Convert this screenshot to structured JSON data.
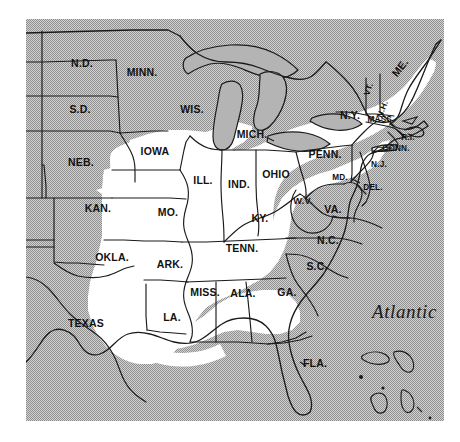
{
  "figure": {
    "kind": "reference-map",
    "background_color": "#b4b4b4",
    "land_highlight_color": "#ffffff",
    "ink_color": "#1a1a1a",
    "page_color": "#ffffff"
  },
  "ocean": {
    "atlantic_label": "Atlantic"
  },
  "states": [
    {
      "id": "nd",
      "label": "N.D.",
      "x": 82,
      "y": 67,
      "size": "normal"
    },
    {
      "id": "sd",
      "label": "S.D.",
      "x": 80,
      "y": 113,
      "size": "normal"
    },
    {
      "id": "neb",
      "label": "NEB.",
      "x": 81,
      "y": 166,
      "size": "normal"
    },
    {
      "id": "kan",
      "label": "KAN.",
      "x": 98,
      "y": 212,
      "size": "normal"
    },
    {
      "id": "okla",
      "label": "OKLA.",
      "x": 112,
      "y": 261,
      "size": "normal"
    },
    {
      "id": "texas",
      "label": "TEXAS",
      "x": 86,
      "y": 327,
      "size": "normal"
    },
    {
      "id": "minn",
      "label": "MINN.",
      "x": 142,
      "y": 76,
      "size": "normal"
    },
    {
      "id": "iowa",
      "label": "IOWA",
      "x": 155,
      "y": 155,
      "size": "normal"
    },
    {
      "id": "mo",
      "label": "MO.",
      "x": 168,
      "y": 216,
      "size": "normal"
    },
    {
      "id": "ark",
      "label": "ARK.",
      "x": 170,
      "y": 268,
      "size": "normal"
    },
    {
      "id": "la",
      "label": "LA.",
      "x": 172,
      "y": 321,
      "size": "normal"
    },
    {
      "id": "wis",
      "label": "WIS.",
      "x": 192,
      "y": 113,
      "size": "normal"
    },
    {
      "id": "ill",
      "label": "ILL.",
      "x": 203,
      "y": 184,
      "size": "normal"
    },
    {
      "id": "miss",
      "label": "MISS.",
      "x": 205,
      "y": 296,
      "size": "normal"
    },
    {
      "id": "mich",
      "label": "MICH.",
      "x": 252,
      "y": 138,
      "size": "normal"
    },
    {
      "id": "ind",
      "label": "IND.",
      "x": 239,
      "y": 188,
      "size": "normal"
    },
    {
      "id": "tenn",
      "label": "TENN.",
      "x": 242,
      "y": 252,
      "size": "normal"
    },
    {
      "id": "ala",
      "label": "ALA.",
      "x": 243,
      "y": 297,
      "size": "normal"
    },
    {
      "id": "ohio",
      "label": "OHIO",
      "x": 276,
      "y": 178,
      "size": "normal"
    },
    {
      "id": "ky",
      "label": "KY.",
      "x": 260,
      "y": 222,
      "size": "normal"
    },
    {
      "id": "ga",
      "label": "GA.",
      "x": 287,
      "y": 296,
      "size": "normal"
    },
    {
      "id": "wv",
      "label": "W.V.",
      "x": 303,
      "y": 204,
      "size": "small"
    },
    {
      "id": "va",
      "label": "VA.",
      "x": 333,
      "y": 213,
      "size": "normal"
    },
    {
      "id": "nc",
      "label": "N.C.",
      "x": 328,
      "y": 244,
      "size": "normal"
    },
    {
      "id": "sc",
      "label": "S.C.",
      "x": 317,
      "y": 270,
      "size": "normal"
    },
    {
      "id": "fla",
      "label": "FLA.",
      "x": 315,
      "y": 367,
      "size": "normal"
    },
    {
      "id": "penn",
      "label": "PENN.",
      "x": 325,
      "y": 158,
      "size": "normal"
    },
    {
      "id": "ny",
      "label": "N.Y.",
      "x": 350,
      "y": 119,
      "size": "normal"
    },
    {
      "id": "md",
      "label": "MD.",
      "x": 340,
      "y": 180,
      "size": "tiny"
    },
    {
      "id": "del",
      "label": "DEL.",
      "x": 373,
      "y": 190,
      "size": "tiny"
    },
    {
      "id": "nj",
      "label": "N.J.",
      "x": 379,
      "y": 167,
      "size": "tiny"
    },
    {
      "id": "vt",
      "label": "VT.",
      "x": 371,
      "y": 90,
      "size": "tiny",
      "rotate": -72
    },
    {
      "id": "nh",
      "label": "N.H.",
      "x": 385,
      "y": 110,
      "size": "tiny",
      "rotate": -68
    },
    {
      "id": "me",
      "label": "ME.",
      "x": 403,
      "y": 70,
      "size": "normal",
      "rotate": -52
    },
    {
      "id": "mass",
      "label": "MASS.",
      "x": 381,
      "y": 122,
      "size": "tiny"
    },
    {
      "id": "ri",
      "label": "R.I.",
      "x": 408,
      "y": 140,
      "size": "tiny"
    },
    {
      "id": "conn",
      "label": "CONN.",
      "x": 396,
      "y": 151,
      "size": "tiny"
    }
  ],
  "leaders": [
    {
      "id": "leader-mass",
      "from": "MASS.",
      "path": "M403,121 L417,118 L414,124"
    },
    {
      "id": "leader-ri",
      "path": "M405,137 L398,130"
    },
    {
      "id": "leader-conn",
      "path": "M393,147 L372,152 L377,147"
    },
    {
      "id": "leader-md",
      "path": "M351,178 L360,183"
    },
    {
      "id": "leader-fla",
      "path": "M305,366 L300,362"
    }
  ]
}
